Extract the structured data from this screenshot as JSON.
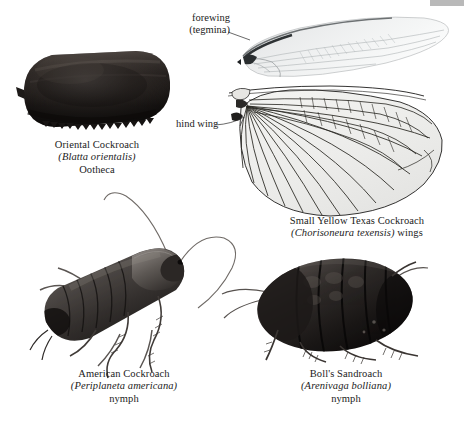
{
  "plate": {
    "background_color": "#ffffff",
    "text_color": "#1b1b1b",
    "width": 464,
    "height": 423,
    "page_edge_color": "#b9b9b9"
  },
  "labels": {
    "forewing": {
      "line1": "forewing",
      "line2": "(tegmina)"
    },
    "hind_wing": {
      "line1": "hind wing"
    }
  },
  "captions": {
    "ootheca": {
      "common_name": "Oriental Cockroach",
      "scientific_name": "(Blatta orientalis)",
      "stage": "Ootheca"
    },
    "wings": {
      "common_name": "Small Yellow Texas Cockroach",
      "scientific_name": "(Chorisoneura texensis)",
      "stage": "wings"
    },
    "american": {
      "common_name": "American Cockroach",
      "scientific_name": "(Periplaneta americana)",
      "stage": "nymph"
    },
    "bolls": {
      "common_name": "Boll's Sandroach",
      "scientific_name": "(Arenivaga bolliana)",
      "stage": "nymph"
    }
  },
  "specimens": {
    "ootheca_name": "oriental-cockroach-ootheca",
    "forewing_name": "forewing-tegmina-specimen",
    "hindwing_name": "hind-wing-specimen",
    "american_nymph_name": "american-cockroach-nymph",
    "bolls_nymph_name": "bolls-sandroach-nymph"
  }
}
